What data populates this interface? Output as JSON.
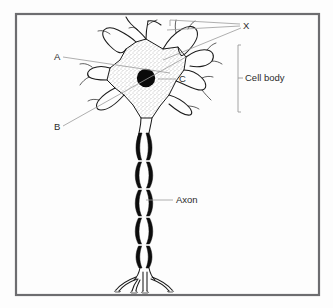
{
  "figure": {
    "background_color": "#fdfdfd",
    "frame_color": "#6d6d70",
    "ink_color": "#1a1a1a",
    "leader_color": "#9a9a9a",
    "text_color": "#2b2b2b"
  },
  "labels": {
    "a": "A",
    "b": "B",
    "c": "C",
    "x": "X",
    "cell_body": "Cell body",
    "axon": "Axon"
  }
}
